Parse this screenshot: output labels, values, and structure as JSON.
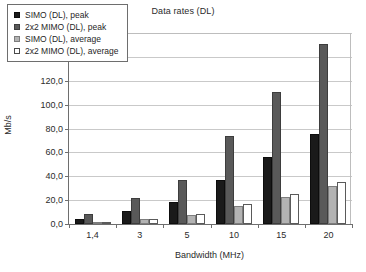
{
  "chart_data": {
    "type": "bar",
    "title": "Data rates (DL)",
    "xlabel": "Bandwidth (MHz)",
    "ylabel": "Mb/s",
    "categories": [
      "1,4",
      "3",
      "5",
      "10",
      "15",
      "20"
    ],
    "series": [
      {
        "name": "SIMO (DL), peak",
        "color": "#1a1a1a",
        "values": [
          4.4,
          11.2,
          18.6,
          36.8,
          55.8,
          75.6
        ]
      },
      {
        "name": "2x2 MIMO (DL), peak",
        "color": "#595959",
        "values": [
          8.8,
          21.6,
          37.0,
          73.4,
          110.4,
          151.0
        ]
      },
      {
        "name": "SIMO (DL), average",
        "color": "#b3b3b3",
        "values": [
          1.2,
          3.8,
          7.4,
          14.8,
          22.4,
          31.5
        ]
      },
      {
        "name": "2x2 MIMO (DL), average",
        "color": "#ffffff",
        "values": [
          1.6,
          4.6,
          8.5,
          17.0,
          25.5,
          35.5
        ]
      }
    ],
    "ylim": [
      0,
      160
    ],
    "ytick_step": 20,
    "ytick_labels": [
      "0,0",
      "20,0",
      "40,0",
      "60,0",
      "80,0",
      "100,0",
      "120,0",
      "140,0",
      "160,0"
    ],
    "grid": true,
    "legend_position": "upper-left-inside",
    "legend_entries": [
      "SIMO (DL), peak",
      "2x2 MIMO (DL), peak",
      "SIMO (DL), average",
      "2x2 MIMO (DL), average"
    ]
  }
}
